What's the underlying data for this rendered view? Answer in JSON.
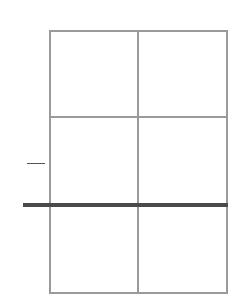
{
  "diagram": {
    "type": "grid",
    "rows": 3,
    "columns": 2,
    "grid_color": "#9a9a9a",
    "highlight_line_color": "#4a4a4a",
    "marker_color": "#555555",
    "highlighted_boundary": "between row 2 and row 3",
    "side_marker": "short dash left of grid at middle of row 2"
  }
}
